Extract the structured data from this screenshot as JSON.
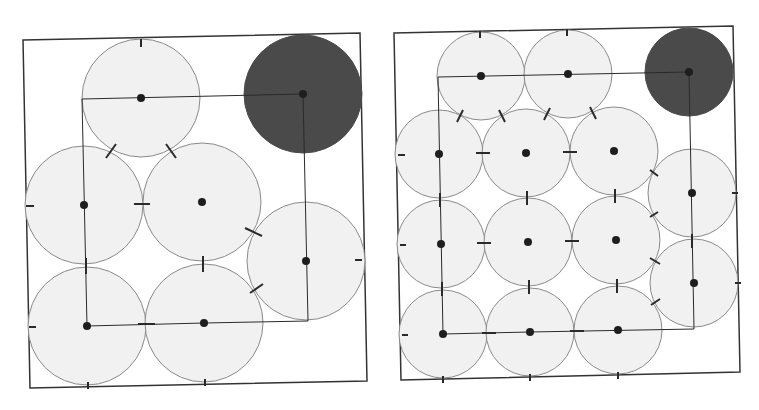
{
  "colors": {
    "background": "#ffffff",
    "circle_fill": "#f1f1f1",
    "circle_stroke": "#8a8a8a",
    "dark_fill": "#4a4a4a",
    "line": "#2a2a2a",
    "dot": "#1e1e1e",
    "frame": "#333333"
  },
  "panels": [
    {
      "name": "left-packing-panel",
      "frame": [
        [
          23,
          40
        ],
        [
          360,
          33
        ],
        [
          367,
          381
        ],
        [
          30,
          388
        ]
      ],
      "radius": 59,
      "circles": [
        {
          "cx": 141,
          "cy": 98,
          "dark": false
        },
        {
          "cx": 303,
          "cy": 94,
          "dark": true
        },
        {
          "cx": 84,
          "cy": 205,
          "dark": false
        },
        {
          "cx": 202,
          "cy": 202,
          "dark": false
        },
        {
          "cx": 306,
          "cy": 261,
          "dark": false
        },
        {
          "cx": 87,
          "cy": 326,
          "dark": false
        },
        {
          "cx": 204,
          "cy": 323,
          "dark": false
        }
      ],
      "path": [
        [
          303,
          94
        ],
        [
          82,
          99
        ],
        [
          87,
          326
        ],
        [
          204,
          323
        ],
        [
          308,
          321
        ],
        [
          303,
          94
        ]
      ],
      "ticks": [
        [
          141,
          39,
          141,
          47
        ],
        [
          116,
          144,
          106,
          158
        ],
        [
          166,
          144,
          176,
          158
        ],
        [
          26,
          206,
          34,
          206
        ],
        [
          134,
          204,
          150,
          204
        ],
        [
          245,
          228,
          262,
          236
        ],
        [
          355,
          260,
          362,
          260
        ],
        [
          86,
          258,
          86,
          274
        ],
        [
          203,
          256,
          203,
          272
        ],
        [
          250,
          293,
          263,
          284
        ],
        [
          29,
          327,
          36,
          327
        ],
        [
          138,
          324,
          155,
          324
        ],
        [
          88,
          382,
          88,
          389
        ],
        [
          205,
          379,
          205,
          386
        ]
      ]
    },
    {
      "name": "right-packing-panel",
      "frame": [
        [
          394,
          33
        ],
        [
          733,
          26
        ],
        [
          740,
          372
        ],
        [
          401,
          380
        ]
      ],
      "radius": 44,
      "circles": [
        {
          "cx": 481,
          "cy": 76,
          "dark": false
        },
        {
          "cx": 568,
          "cy": 74,
          "dark": false
        },
        {
          "cx": 689,
          "cy": 72,
          "dark": true
        },
        {
          "cx": 439,
          "cy": 154,
          "dark": false
        },
        {
          "cx": 526,
          "cy": 153,
          "dark": false
        },
        {
          "cx": 614,
          "cy": 151,
          "dark": false
        },
        {
          "cx": 692,
          "cy": 193,
          "dark": false
        },
        {
          "cx": 441,
          "cy": 244,
          "dark": false
        },
        {
          "cx": 528,
          "cy": 242,
          "dark": false
        },
        {
          "cx": 616,
          "cy": 240,
          "dark": false
        },
        {
          "cx": 694,
          "cy": 283,
          "dark": false
        },
        {
          "cx": 443,
          "cy": 334,
          "dark": false
        },
        {
          "cx": 530,
          "cy": 332,
          "dark": false
        },
        {
          "cx": 618,
          "cy": 330,
          "dark": false
        }
      ],
      "path": [
        [
          689,
          72
        ],
        [
          438,
          77
        ],
        [
          443,
          334
        ],
        [
          530,
          332
        ],
        [
          694,
          329
        ],
        [
          689,
          72
        ]
      ],
      "ticks": [
        [
          480,
          31,
          480,
          38
        ],
        [
          567,
          29,
          567,
          36
        ],
        [
          463,
          110,
          457,
          122
        ],
        [
          499,
          110,
          505,
          122
        ],
        [
          550,
          108,
          544,
          120
        ],
        [
          590,
          107,
          596,
          119
        ],
        [
          398,
          155,
          405,
          155
        ],
        [
          476,
          153,
          490,
          153
        ],
        [
          563,
          152,
          577,
          152
        ],
        [
          650,
          170,
          658,
          176
        ],
        [
          732,
          193,
          738,
          193
        ],
        [
          440,
          193,
          440,
          207
        ],
        [
          527,
          191,
          527,
          205
        ],
        [
          615,
          189,
          615,
          203
        ],
        [
          650,
          217,
          658,
          212
        ],
        [
          400,
          245,
          406,
          245
        ],
        [
          477,
          243,
          491,
          243
        ],
        [
          565,
          241,
          579,
          241
        ],
        [
          692,
          234,
          692,
          248
        ],
        [
          442,
          282,
          442,
          296
        ],
        [
          529,
          280,
          529,
          294
        ],
        [
          617,
          279,
          617,
          293
        ],
        [
          650,
          258,
          660,
          264
        ],
        [
          735,
          283,
          741,
          283
        ],
        [
          651,
          305,
          660,
          299
        ],
        [
          402,
          335,
          408,
          335
        ],
        [
          482,
          333,
          496,
          333
        ],
        [
          570,
          331,
          584,
          331
        ],
        [
          443,
          376,
          443,
          383
        ],
        [
          530,
          374,
          530,
          381
        ],
        [
          618,
          372,
          618,
          379
        ]
      ]
    }
  ]
}
